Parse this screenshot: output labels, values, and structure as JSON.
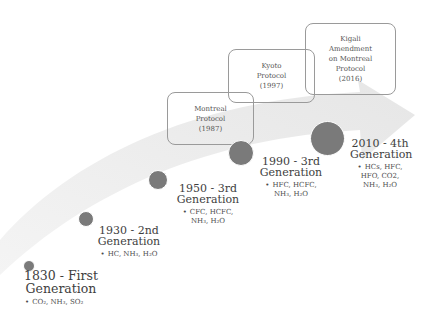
{
  "diagram": {
    "type": "timeline",
    "colors": {
      "dot": "#7a7a7a",
      "arrow": "#ececec",
      "box_border": "#9a9a9a",
      "text": "#3e3e3e"
    },
    "generations": [
      {
        "title_line1": "1830 - First",
        "title_line2": "Generation",
        "items": "CO₂, NH₃, SO₂"
      },
      {
        "title_line1": "1930 - 2nd",
        "title_line2": "Generation",
        "items": "HC, NH₃, H₂O"
      },
      {
        "title_line1": "1950 - 3rd",
        "title_line2": "Generation",
        "items_line1": "CFC, HCFC,",
        "items_line2": "NH₃, H₂O"
      },
      {
        "title_line1": "1990 - 3rd",
        "title_line2": "Generation",
        "items_line1": "HFC, HCFC,",
        "items_line2": "NH₃, H₂O"
      },
      {
        "title_line1": "2010 - 4th",
        "title_line2": "Generation",
        "items_line1": "HCs, HFC,",
        "items_line2": "HFO, CO2,",
        "items_line3": "NH₃, H₂O"
      }
    ],
    "protocols": [
      {
        "line1": "Montreal",
        "line2": "Protocol",
        "line3": "(1987)"
      },
      {
        "line1": "Kyoto",
        "line2": "Protocol",
        "line3": "(1997)"
      },
      {
        "line1": "Kigali",
        "line2": "Amendment",
        "line3": "on Montreal",
        "line4": "Protocol",
        "line5": "(2016)"
      }
    ],
    "bullet": "•"
  }
}
